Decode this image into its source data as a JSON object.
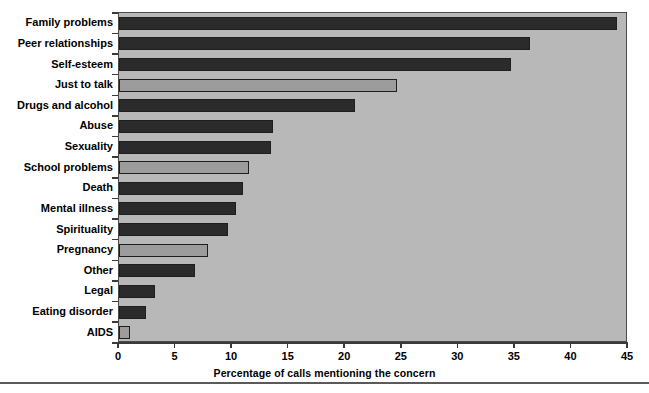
{
  "chart_data": {
    "type": "bar",
    "orientation": "horizontal",
    "title": "",
    "xlabel": "Percentage of calls mentioning the concern",
    "ylabel": "",
    "xlim": [
      0,
      45
    ],
    "xticks": [
      0,
      5,
      10,
      15,
      20,
      25,
      30,
      35,
      40,
      45
    ],
    "xtick_labels": [
      "0",
      "5",
      "10",
      "15",
      "20",
      "25",
      "30",
      "35",
      "40",
      "45"
    ],
    "grid": false,
    "legend": null,
    "plot_background": "#b8b8b8",
    "bar_colors": {
      "dark": "#2b2b2b",
      "light": "#9c9c9c"
    },
    "categories": [
      "Family problems",
      "Peer relationships",
      "Self-esteem",
      "Just to talk",
      "Drugs and alcohol",
      "Abuse",
      "Sexuality",
      "School problems",
      "Death",
      "Mental illness",
      "Spirituality",
      "Pregnancy",
      "Other",
      "Legal",
      "Eating disorder",
      "AIDS"
    ],
    "values": [
      44.0,
      36.3,
      34.7,
      24.6,
      20.9,
      13.6,
      13.4,
      11.5,
      11.0,
      10.3,
      9.6,
      7.9,
      6.7,
      3.2,
      2.4,
      1.0
    ],
    "bar_shades": [
      "dark",
      "dark",
      "dark",
      "light",
      "dark",
      "dark",
      "dark",
      "light",
      "dark",
      "dark",
      "dark",
      "light",
      "dark",
      "dark",
      "dark",
      "light"
    ]
  }
}
